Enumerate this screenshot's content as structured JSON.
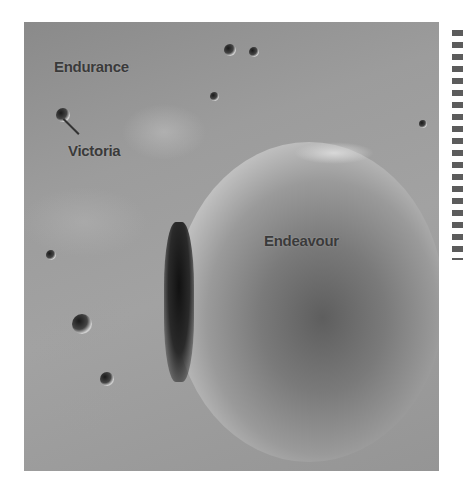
{
  "map": {
    "title": "",
    "labels": [
      {
        "name": "Endurance",
        "x": 30,
        "y": 36
      },
      {
        "name": "Victoria",
        "x": 44,
        "y": 120
      },
      {
        "name": "Endeavour",
        "x": 240,
        "y": 210
      }
    ]
  },
  "colors": {
    "terrain": "#9c9c9c",
    "label_text": "#3a3a3a",
    "background": "#ffffff"
  }
}
